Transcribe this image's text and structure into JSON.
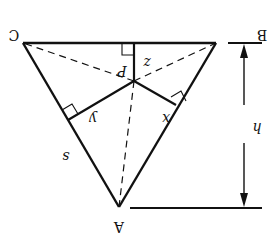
{
  "diagram": {
    "rotation_deg": 180,
    "colors": {
      "stroke": "#111111",
      "background": "#ffffff"
    },
    "vertices": {
      "A": {
        "label": "A",
        "x": 119,
        "y": 207
      },
      "B": {
        "label": "B",
        "x": 216,
        "y": 43
      },
      "C": {
        "label": "C",
        "x": 23,
        "y": 43
      },
      "P": {
        "label": "P",
        "x": 134,
        "y": 81
      }
    },
    "labels": {
      "A": "A",
      "B": "B",
      "C": "C",
      "P": "P",
      "x": "x",
      "y": "y",
      "z": "z",
      "s": "s",
      "h": "h"
    },
    "segments": {
      "sides": "solid triangle sides AB, BC, CA (side length s)",
      "perpendiculars": "solid segments from P perpendicular to each side with right-angle marks (lengths x, y, z)",
      "dashed": "dashed segments from P to vertices A, B, C",
      "height": "dimension arrow h between base line through B–C and line through A"
    }
  }
}
